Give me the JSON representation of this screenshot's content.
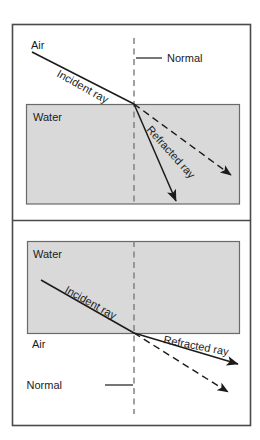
{
  "figure": {
    "background_color": "#ffffff",
    "border_color": "#4a4a4a",
    "water_fill_color": "#d9d9d9",
    "water_stroke_color": "#6a6a6a",
    "ray_color": "#1b1b1b",
    "normal_color": "#7a7a7a",
    "text_color": "#1b1b1b"
  },
  "panels": [
    {
      "id": "air-to-water",
      "description": "Light travelling from air into water bends toward the normal",
      "medium_upper": "Air",
      "medium_lower": "Water",
      "labels": {
        "upper_medium": "Air",
        "lower_medium": "Water",
        "normal": "Normal",
        "incident_ray": "Incident ray",
        "refracted_ray": "Refracted ray"
      },
      "geometry": {
        "boundary_y": 104,
        "incidence_point": [
          134,
          104
        ],
        "incident_start": [
          32,
          52
        ],
        "refracted_end": [
          176,
          201
        ],
        "undeviated_end": [
          231,
          175
        ],
        "normal_top": [
          134,
          38
        ],
        "normal_bottom": [
          134,
          204
        ],
        "incident_label_angle": 29,
        "refracted_label_angle": 48
      }
    },
    {
      "id": "water-to-air",
      "description": "Light travelling from water into air bends away from the normal",
      "medium_upper": "Water",
      "medium_lower": "Air",
      "labels": {
        "upper_medium": "Water",
        "lower_medium": "Air",
        "normal": "Normal",
        "incident_ray": "Incident ray",
        "refracted_ray": "Refracted ray"
      },
      "geometry": {
        "boundary_y": 333,
        "incidence_point": [
          134,
          333
        ],
        "incident_start": [
          41,
          280
        ],
        "refracted_end": [
          238,
          364
        ],
        "undeviated_end": [
          228,
          392
        ],
        "normal_top": [
          134,
          241
        ],
        "normal_bottom": [
          134,
          414
        ],
        "incident_label_angle": 29,
        "refracted_label_angle": 11
      }
    }
  ]
}
